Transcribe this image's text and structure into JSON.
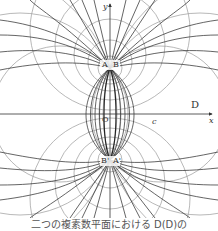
{
  "figure": {
    "axes": {
      "x_label": "x",
      "y_label": "y",
      "origin_label": "O",
      "region_label": "D"
    },
    "pole_labels": {
      "top_left": "A",
      "top_right": "B",
      "bottom_left": "B'",
      "bottom_right": "A'"
    },
    "point_label_c": "c",
    "colors": {
      "black_lines": "#222222",
      "grey_lines": "#9a9a9a",
      "background": "#ffffff"
    }
  },
  "caption": "二つの複素数平面における D(D)の"
}
